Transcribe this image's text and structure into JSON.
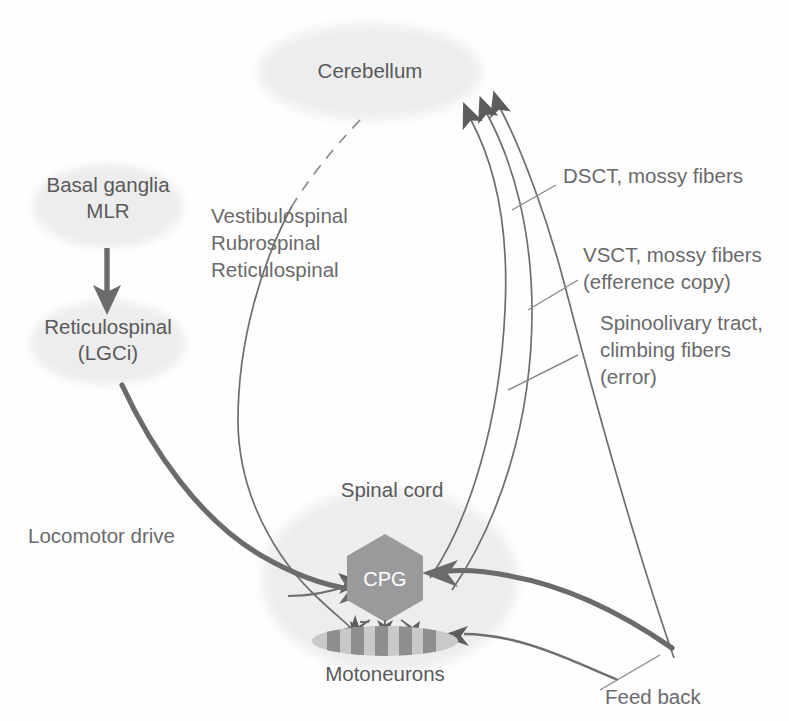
{
  "figure": {
    "background_color": "#fefefe",
    "text_color": "#59595b",
    "blob_color": "#ededed",
    "cpg_color": "#9a9a9c",
    "arrow_color": "#6b6b6d"
  },
  "nodes": {
    "cerebellum": {
      "label": "Cerebellum"
    },
    "basal_ganglia": {
      "label_line1": "Basal ganglia",
      "label_line2": "MLR"
    },
    "reticulospinal": {
      "label_line1": "Reticulospinal",
      "label_line2": "(LGCi)"
    },
    "spinal_cord": {
      "label": "Spinal cord"
    },
    "cpg": {
      "label": "CPG"
    },
    "motoneurons": {
      "label": "Motoneurons"
    }
  },
  "annotations": {
    "descending_tracts": {
      "line1": "Vestibulospinal",
      "line2": "Rubrospinal",
      "line3": "Reticulospinal"
    },
    "dsct": {
      "line1": "DSCT, mossy fibers"
    },
    "vsct": {
      "line1": "VSCT, mossy fibers",
      "line2": "(efference copy)"
    },
    "spinoolivary": {
      "line1": "Spinoolivary tract,",
      "line2": "climbing fibers",
      "line3": "(error)"
    },
    "locomotor_drive": {
      "label": "Locomotor drive"
    },
    "feedback": {
      "label": "Feed back"
    }
  }
}
